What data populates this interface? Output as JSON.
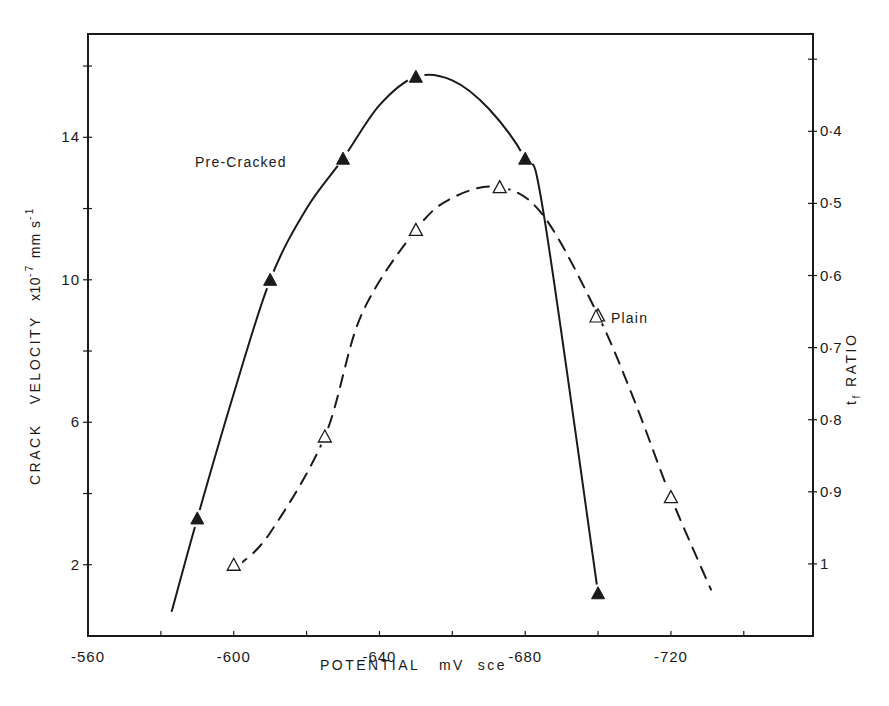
{
  "chart_data": {
    "type": "line",
    "title": "",
    "xlabel": "POTENTIAL   mV  sce",
    "ylabel": {
      "main": "CRACK   VELOCITY",
      "unit_prefix": "x10",
      "unit_exp": "-7",
      "unit_mid": " mm s",
      "unit_exp2": "-1"
    },
    "y2label": {
      "main": "t",
      "sub": "f",
      "rest": " RATIO"
    },
    "xlim": [
      -560,
      -759
    ],
    "ylim": [
      0,
      16.9
    ],
    "y2lim": [
      1.1,
      0.265
    ],
    "grid": false,
    "x_ticks": [
      -560,
      -580,
      -600,
      -620,
      -640,
      -660,
      -680,
      -700,
      -720,
      -740
    ],
    "x_tick_labels": [
      {
        "value": -560,
        "label": "-560"
      },
      {
        "value": -600,
        "label": "-600"
      },
      {
        "value": -640,
        "label": "-640"
      },
      {
        "value": -680,
        "label": "-680"
      },
      {
        "value": -720,
        "label": "-720"
      }
    ],
    "y_ticks": [
      2,
      4,
      6,
      8,
      10,
      12,
      14,
      16
    ],
    "y_tick_labels": [
      {
        "value": 2,
        "label": "2"
      },
      {
        "value": 6,
        "label": "6"
      },
      {
        "value": 10,
        "label": "10"
      },
      {
        "value": 14,
        "label": "14"
      }
    ],
    "y2_ticks": [
      0.3,
      0.4,
      0.5,
      0.6,
      0.7,
      0.8,
      0.9,
      1.0
    ],
    "y2_tick_labels": [
      {
        "value": 0.4,
        "label": "0·4"
      },
      {
        "value": 0.5,
        "label": "0·5"
      },
      {
        "value": 0.6,
        "label": "0·6"
      },
      {
        "value": 0.7,
        "label": "0·7"
      },
      {
        "value": 0.8,
        "label": "0·8"
      },
      {
        "value": 0.9,
        "label": "0·9"
      },
      {
        "value": 1.0,
        "label": "1"
      }
    ],
    "series": [
      {
        "name": "Pre-Cracked",
        "marker": "filled-triangle",
        "line_style": "solid",
        "x": [
          -590,
          -610,
          -630,
          -650,
          -680,
          -700
        ],
        "y": [
          3.3,
          10.0,
          13.4,
          15.7,
          13.4,
          1.2
        ],
        "curve_x": [
          -583,
          -590,
          -600,
          -610,
          -620,
          -630,
          -640,
          -650,
          -660,
          -670,
          -680,
          -685,
          -700
        ],
        "curve_y": [
          0.7,
          3.3,
          6.8,
          10.0,
          12.0,
          13.4,
          14.9,
          15.7,
          15.6,
          14.8,
          13.4,
          11.9,
          1.2
        ]
      },
      {
        "name": "Plain",
        "marker": "open-triangle",
        "line_style": "dashed",
        "x": [
          -600,
          -625,
          -650,
          -673,
          -700,
          -720
        ],
        "y": [
          2.0,
          5.6,
          11.4,
          12.6,
          9.0,
          3.9
        ],
        "curve_x": [
          -601,
          -610,
          -625,
          -635,
          -650,
          -660,
          -673,
          -685,
          -700,
          -710,
          -720,
          -731
        ],
        "curve_y": [
          1.95,
          2.9,
          5.6,
          9.0,
          11.4,
          12.3,
          12.6,
          11.8,
          9.0,
          6.6,
          3.9,
          1.3
        ]
      }
    ],
    "annotations": [
      {
        "text": "Pre-Cracked",
        "series": "Pre-Cracked"
      },
      {
        "text": "Plain",
        "series": "Plain"
      }
    ]
  }
}
